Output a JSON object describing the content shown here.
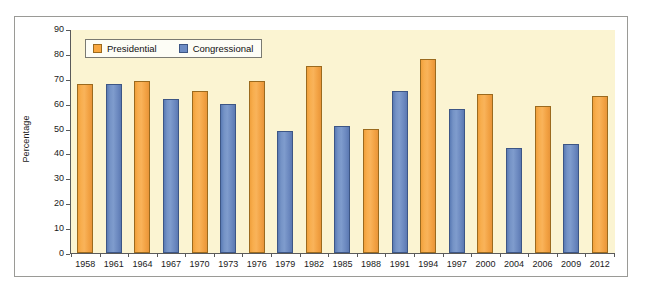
{
  "chart_data": {
    "type": "bar",
    "title": "",
    "xlabel": "",
    "ylabel": "Percentage",
    "ylim": [
      0,
      90
    ],
    "yticks": [
      0,
      10,
      20,
      30,
      40,
      50,
      60,
      70,
      80,
      90
    ],
    "grid": false,
    "legend_position": "top-left",
    "categories": [
      "1958",
      "1961",
      "1964",
      "1967",
      "1970",
      "1973",
      "1976",
      "1979",
      "1982",
      "1985",
      "1988",
      "1991",
      "1994",
      "1997",
      "2000",
      "2004",
      "2006",
      "2009",
      "2012"
    ],
    "series": [
      {
        "name": "Presidential",
        "color": "#f8a73f",
        "values": [
          68,
          null,
          69,
          null,
          65,
          null,
          69,
          null,
          75,
          null,
          50,
          null,
          78,
          null,
          64,
          null,
          59,
          null,
          63
        ]
      },
      {
        "name": "Congressional",
        "color": "#6d8cc4",
        "values": [
          null,
          68,
          null,
          62,
          null,
          60,
          null,
          49,
          null,
          51,
          null,
          65,
          null,
          58,
          null,
          42,
          null,
          44,
          null
        ]
      }
    ],
    "points": [
      {
        "category": "1958",
        "series": "Presidential",
        "value": 68
      },
      {
        "category": "1961",
        "series": "Congressional",
        "value": 68
      },
      {
        "category": "1964",
        "series": "Presidential",
        "value": 69
      },
      {
        "category": "1967",
        "series": "Congressional",
        "value": 62
      },
      {
        "category": "1970",
        "series": "Presidential",
        "value": 65
      },
      {
        "category": "1973",
        "series": "Congressional",
        "value": 60
      },
      {
        "category": "1976",
        "series": "Presidential",
        "value": 69
      },
      {
        "category": "1979",
        "series": "Congressional",
        "value": 49
      },
      {
        "category": "1982",
        "series": "Presidential",
        "value": 75
      },
      {
        "category": "1985",
        "series": "Congressional",
        "value": 51
      },
      {
        "category": "1988",
        "series": "Presidential",
        "value": 50
      },
      {
        "category": "1991",
        "series": "Congressional",
        "value": 65
      },
      {
        "category": "1994",
        "series": "Presidential",
        "value": 78
      },
      {
        "category": "1997",
        "series": "Congressional",
        "value": 58
      },
      {
        "category": "2000",
        "series": "Presidential",
        "value": 64
      },
      {
        "category": "2004",
        "series": "Congressional",
        "value": 42
      },
      {
        "category": "2006",
        "series": "Presidential",
        "value": 59
      },
      {
        "category": "2009",
        "series": "Congressional",
        "value": 44
      },
      {
        "category": "2012",
        "series": "Presidential",
        "value": 63
      }
    ]
  },
  "legend": {
    "entries": [
      {
        "label": "Presidential",
        "color": "#f8a73f"
      },
      {
        "label": "Congressional",
        "color": "#6d8cc4"
      }
    ]
  },
  "colors": {
    "plot_background": "#fbf4d2",
    "figure_background": "#ffffff",
    "axis": "#5a5a5a",
    "presidential": "#f8a73f",
    "congressional": "#6d8cc4"
  }
}
